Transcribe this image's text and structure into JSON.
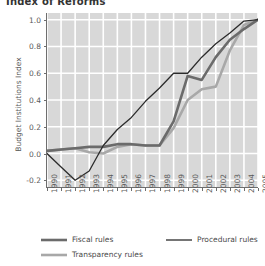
{
  "chart_data": {
    "type": "line",
    "title": "Index of Reforms",
    "xlabel": "",
    "ylabel": "Budget Institutions Index",
    "x": [
      1990,
      1991,
      1992,
      1993,
      1994,
      1995,
      1996,
      1997,
      1998,
      1999,
      2000,
      2001,
      2002,
      2003,
      2004,
      2005
    ],
    "xlim": [
      1990,
      2005
    ],
    "ylim": [
      -0.25,
      1.05
    ],
    "yticks": [
      -0.2,
      0.0,
      0.2,
      0.4,
      0.6,
      0.8,
      1.0
    ],
    "ytick_labels": [
      "-0.2",
      "0.0",
      "0.2",
      "0.4",
      "0.6",
      "0.8",
      "1.0"
    ],
    "xtick_labels": [
      "1990",
      "1991",
      "1992",
      "1993",
      "1994",
      "1995",
      "1996",
      "1997",
      "1998",
      "1999",
      "2000",
      "2001",
      "2002",
      "2003",
      "2004",
      "2005"
    ],
    "grid": true,
    "grid_color": "#ffffff",
    "plot_bg": "#d8d8d8",
    "legend_position": "below",
    "series": [
      {
        "name": "Fiscal rules",
        "color": "#6b6b6b",
        "width": 2.6,
        "values": [
          0.02,
          0.03,
          0.04,
          0.05,
          0.05,
          0.07,
          0.07,
          0.06,
          0.06,
          0.24,
          0.58,
          0.55,
          0.72,
          0.85,
          0.93,
          1.0
        ]
      },
      {
        "name": "Procedural rules",
        "color": "#2b2b2b",
        "width": 1.3,
        "values": [
          0.0,
          -0.1,
          -0.2,
          -0.13,
          0.06,
          0.18,
          0.27,
          0.39,
          0.49,
          0.6,
          0.6,
          0.72,
          0.82,
          0.9,
          0.99,
          1.0
        ]
      },
      {
        "name": "Transparency rules",
        "color": "#a8a8a8",
        "width": 2.6,
        "values": [
          0.02,
          0.03,
          0.04,
          0.01,
          0.0,
          0.05,
          0.07,
          0.06,
          0.06,
          0.19,
          0.4,
          0.48,
          0.5,
          0.77,
          0.96,
          1.0
        ]
      }
    ]
  },
  "legend": {
    "items": [
      {
        "label": "Fiscal rules"
      },
      {
        "label": "Procedural rules"
      },
      {
        "label": "Transparency rules"
      }
    ]
  }
}
